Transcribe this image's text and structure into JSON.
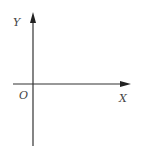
{
  "diagram": {
    "type": "coordinate-axes",
    "labels": {
      "y_axis": "Y",
      "x_axis": "X",
      "origin": "O"
    },
    "colors": {
      "axis": "#333333",
      "label": "#444444",
      "background": "#ffffff"
    }
  }
}
